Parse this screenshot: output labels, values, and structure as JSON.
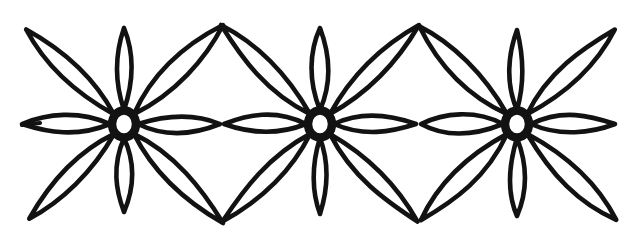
{
  "artwork": {
    "title": "Floral Border Ornament",
    "description": "Hand-drawn black ink repeating border of three eight-petal flowers",
    "style": "line-art",
    "canvas": {
      "width": 636,
      "height": 240
    },
    "colors": {
      "background": "#ffffff",
      "ink": "#121212",
      "petal_fill": "#ffffff"
    },
    "stroke": {
      "petal_width": 4.6,
      "core_ring_width": 8.5,
      "tail_width": 4.2
    },
    "motif": {
      "name": "eight-petal-flower",
      "petal_count": 8,
      "core_outer_radius": 16,
      "core_inner_radius": 11
    },
    "flowers": [
      {
        "id": "flower-left",
        "label": "Left flower",
        "center": {
          "x": 124,
          "y": 124
        },
        "petals": [
          {
            "name": "petal-up",
            "angle": 270,
            "length": 96,
            "halfwidth": 11,
            "kind": "short"
          },
          {
            "name": "petal-down",
            "angle": 90,
            "length": 88,
            "halfwidth": 11,
            "kind": "short"
          },
          {
            "name": "petal-left",
            "angle": 180,
            "length": 102,
            "halfwidth": 13,
            "kind": "side"
          },
          {
            "name": "petal-right",
            "angle": 0,
            "length": 96,
            "halfwidth": 13,
            "kind": "side"
          },
          {
            "name": "petal-up-left",
            "angle": 224,
            "length": 136,
            "halfwidth": 14,
            "kind": "long"
          },
          {
            "name": "petal-up-right",
            "angle": 315,
            "length": 140,
            "halfwidth": 14,
            "kind": "long"
          },
          {
            "name": "petal-down-left",
            "angle": 135,
            "length": 134,
            "halfwidth": 14,
            "kind": "long"
          },
          {
            "name": "petal-down-right",
            "angle": 45,
            "length": 140,
            "halfwidth": 14,
            "kind": "long"
          }
        ],
        "tail": {
          "name": "left-edge-tail",
          "from": {
            "x": 22,
            "y": 125
          },
          "to": {
            "x": 40,
            "y": 123
          }
        }
      },
      {
        "id": "flower-center",
        "label": "Center flower",
        "center": {
          "x": 320,
          "y": 124
        },
        "petals": [
          {
            "name": "petal-up",
            "angle": 270,
            "length": 96,
            "halfwidth": 11,
            "kind": "short"
          },
          {
            "name": "petal-down",
            "angle": 90,
            "length": 90,
            "halfwidth": 11,
            "kind": "short"
          },
          {
            "name": "petal-left",
            "angle": 180,
            "length": 96,
            "halfwidth": 13,
            "kind": "side"
          },
          {
            "name": "petal-right",
            "angle": 0,
            "length": 96,
            "halfwidth": 13,
            "kind": "side"
          },
          {
            "name": "petal-up-left",
            "angle": 225,
            "length": 140,
            "halfwidth": 14,
            "kind": "long"
          },
          {
            "name": "petal-up-right",
            "angle": 315,
            "length": 140,
            "halfwidth": 14,
            "kind": "long"
          },
          {
            "name": "petal-down-left",
            "angle": 135,
            "length": 138,
            "halfwidth": 14,
            "kind": "long"
          },
          {
            "name": "petal-down-right",
            "angle": 45,
            "length": 138,
            "halfwidth": 14,
            "kind": "long"
          }
        ],
        "tail": null
      },
      {
        "id": "flower-right",
        "label": "Right flower",
        "center": {
          "x": 517,
          "y": 124
        },
        "petals": [
          {
            "name": "petal-up",
            "angle": 270,
            "length": 94,
            "halfwidth": 11,
            "kind": "short"
          },
          {
            "name": "petal-down",
            "angle": 90,
            "length": 92,
            "halfwidth": 11,
            "kind": "short"
          },
          {
            "name": "petal-left",
            "angle": 180,
            "length": 96,
            "halfwidth": 13,
            "kind": "side"
          },
          {
            "name": "petal-right",
            "angle": 0,
            "length": 98,
            "halfwidth": 13,
            "kind": "side"
          },
          {
            "name": "petal-up-left",
            "angle": 225,
            "length": 138,
            "halfwidth": 14,
            "kind": "long"
          },
          {
            "name": "petal-up-right",
            "angle": 316,
            "length": 136,
            "halfwidth": 14,
            "kind": "long"
          },
          {
            "name": "petal-down-left",
            "angle": 135,
            "length": 136,
            "halfwidth": 14,
            "kind": "long"
          },
          {
            "name": "petal-down-right",
            "angle": 44,
            "length": 138,
            "halfwidth": 14,
            "kind": "long"
          }
        ],
        "tail": null
      }
    ],
    "junctions": [
      {
        "name": "top-junction-1",
        "x": 222,
        "y": 30
      },
      {
        "name": "bottom-junction-1",
        "x": 222,
        "y": 218
      },
      {
        "name": "top-junction-2",
        "x": 419,
        "y": 30
      },
      {
        "name": "bottom-junction-2",
        "x": 419,
        "y": 218
      }
    ]
  }
}
